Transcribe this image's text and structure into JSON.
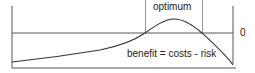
{
  "diagram": {
    "labels": {
      "optimum": "optimum",
      "zero": "0",
      "curve": "benefit = costs - risk"
    },
    "colors": {
      "line": "#333333",
      "grid": "#888888"
    }
  }
}
